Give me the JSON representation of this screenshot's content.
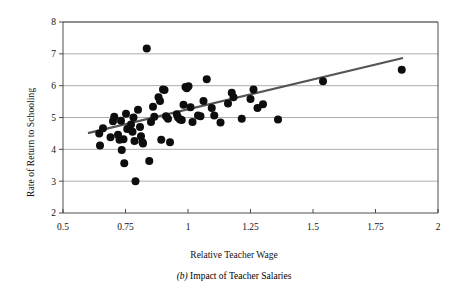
{
  "chart_data": {
    "type": "scatter",
    "title": "",
    "xlabel": "Relative Teacher Wage",
    "ylabel": "Rate of Return to Schooling",
    "xlim": [
      0.5,
      2
    ],
    "ylim": [
      2,
      8
    ],
    "xticks": [
      0.5,
      0.75,
      1,
      1.25,
      1.5,
      1.75,
      2
    ],
    "xtick_labels": [
      "0.5",
      "0.75",
      "1",
      "1.25",
      "1.5",
      "1.75",
      "2"
    ],
    "yticks": [
      2,
      3,
      4,
      5,
      6,
      7,
      8
    ],
    "ytick_labels": [
      "2",
      "3",
      "4",
      "5",
      "6",
      "7",
      "8"
    ],
    "grid": "horizontal",
    "legend": "none",
    "marker": {
      "shape": "circle",
      "color": "#0d0d0d",
      "size_px": 5.2
    },
    "trendline": {
      "type": "linear-fit",
      "color": "#555555",
      "width_px": 2.2,
      "x_start": 0.6,
      "y_start": 4.51,
      "x_end": 1.86,
      "y_end": 6.87
    },
    "points": [
      {
        "x": 0.645,
        "y": 4.5
      },
      {
        "x": 0.648,
        "y": 4.12
      },
      {
        "x": 0.66,
        "y": 4.66
      },
      {
        "x": 0.69,
        "y": 4.38
      },
      {
        "x": 0.7,
        "y": 4.88
      },
      {
        "x": 0.705,
        "y": 5.02
      },
      {
        "x": 0.72,
        "y": 4.46
      },
      {
        "x": 0.726,
        "y": 4.3
      },
      {
        "x": 0.732,
        "y": 4.9
      },
      {
        "x": 0.735,
        "y": 3.98
      },
      {
        "x": 0.742,
        "y": 4.32
      },
      {
        "x": 0.745,
        "y": 3.56
      },
      {
        "x": 0.752,
        "y": 5.12
      },
      {
        "x": 0.757,
        "y": 4.64
      },
      {
        "x": 0.772,
        "y": 4.78
      },
      {
        "x": 0.778,
        "y": 4.55
      },
      {
        "x": 0.782,
        "y": 5.0
      },
      {
        "x": 0.786,
        "y": 4.26
      },
      {
        "x": 0.79,
        "y": 3.0
      },
      {
        "x": 0.8,
        "y": 5.24
      },
      {
        "x": 0.808,
        "y": 4.7
      },
      {
        "x": 0.812,
        "y": 4.41
      },
      {
        "x": 0.818,
        "y": 4.22
      },
      {
        "x": 0.82,
        "y": 4.18
      },
      {
        "x": 0.835,
        "y": 7.17
      },
      {
        "x": 0.845,
        "y": 3.63
      },
      {
        "x": 0.852,
        "y": 4.86
      },
      {
        "x": 0.86,
        "y": 5.34
      },
      {
        "x": 0.865,
        "y": 5.02
      },
      {
        "x": 0.882,
        "y": 5.64
      },
      {
        "x": 0.888,
        "y": 5.52
      },
      {
        "x": 0.893,
        "y": 4.3
      },
      {
        "x": 0.9,
        "y": 5.88
      },
      {
        "x": 0.906,
        "y": 5.86
      },
      {
        "x": 0.912,
        "y": 5.04
      },
      {
        "x": 0.92,
        "y": 4.96
      },
      {
        "x": 0.928,
        "y": 4.22
      },
      {
        "x": 0.955,
        "y": 5.1
      },
      {
        "x": 0.96,
        "y": 5.0
      },
      {
        "x": 0.968,
        "y": 4.94
      },
      {
        "x": 0.975,
        "y": 4.92
      },
      {
        "x": 0.982,
        "y": 5.4
      },
      {
        "x": 0.99,
        "y": 5.96
      },
      {
        "x": 0.995,
        "y": 5.92
      },
      {
        "x": 1.002,
        "y": 5.98
      },
      {
        "x": 1.01,
        "y": 5.32
      },
      {
        "x": 1.018,
        "y": 4.86
      },
      {
        "x": 1.04,
        "y": 5.06
      },
      {
        "x": 1.05,
        "y": 5.04
      },
      {
        "x": 1.062,
        "y": 5.52
      },
      {
        "x": 1.075,
        "y": 6.2
      },
      {
        "x": 1.095,
        "y": 5.3
      },
      {
        "x": 1.105,
        "y": 5.06
      },
      {
        "x": 1.13,
        "y": 4.84
      },
      {
        "x": 1.16,
        "y": 5.44
      },
      {
        "x": 1.175,
        "y": 5.78
      },
      {
        "x": 1.182,
        "y": 5.64
      },
      {
        "x": 1.215,
        "y": 4.96
      },
      {
        "x": 1.25,
        "y": 5.58
      },
      {
        "x": 1.262,
        "y": 5.88
      },
      {
        "x": 1.278,
        "y": 5.3
      },
      {
        "x": 1.3,
        "y": 5.42
      },
      {
        "x": 1.36,
        "y": 4.94
      },
      {
        "x": 1.54,
        "y": 6.14
      },
      {
        "x": 1.855,
        "y": 6.5
      }
    ]
  },
  "caption": {
    "label": "(b)",
    "text": " Impact of Teacher Salaries"
  }
}
